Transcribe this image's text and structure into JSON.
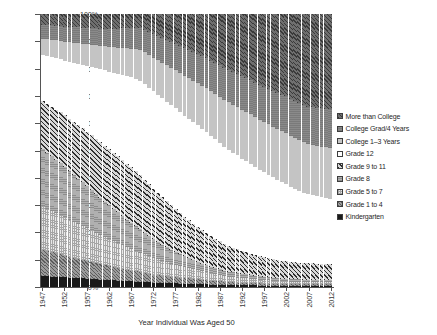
{
  "chart_data": {
    "type": "bar",
    "subtype": "stacked-100-percent",
    "title": "",
    "xlabel": "Year Individual Was Aged 50",
    "ylabel": "",
    "ylim": [
      0,
      100
    ],
    "ytick_labels": [
      "0%",
      "10%",
      "20%",
      "30%",
      "40%",
      "50%",
      "60%",
      "70%",
      "80%",
      "90%",
      "100%"
    ],
    "ytick_values": [
      0,
      10,
      20,
      30,
      40,
      50,
      60,
      70,
      80,
      90,
      100
    ],
    "xtick_labels": [
      "1947",
      "1952",
      "1957",
      "1962",
      "1967",
      "1972",
      "1977",
      "1982",
      "1987",
      "1992",
      "1997",
      "2002",
      "2007",
      "2012"
    ],
    "xtick_values": [
      1947,
      1952,
      1957,
      1962,
      1967,
      1972,
      1977,
      1982,
      1987,
      1992,
      1997,
      2002,
      2007,
      2012
    ],
    "grid": false,
    "legend_position": "right",
    "legend_order_top_to_bottom": [
      "More than College",
      "College Grad/4 Years",
      "College 1–3 Years",
      "Grade 12",
      "Grade 9 to 11",
      "Grade 8",
      "Grade 5 to 7",
      "Grade 1 to 4",
      "Kindergarten"
    ],
    "stack_order_bottom_to_top": [
      "Kindergarten",
      "Grade 1 to 4",
      "Grade 5 to 7",
      "Grade 8",
      "Grade 9 to 11",
      "Grade 12",
      "College 1–3 Years",
      "College Grad/4 Years",
      "More than College"
    ],
    "x": [
      1947,
      1948,
      1949,
      1950,
      1951,
      1952,
      1953,
      1954,
      1955,
      1956,
      1957,
      1958,
      1959,
      1960,
      1961,
      1962,
      1963,
      1964,
      1965,
      1966,
      1967,
      1968,
      1969,
      1970,
      1971,
      1972,
      1973,
      1974,
      1975,
      1976,
      1977,
      1978,
      1979,
      1980,
      1981,
      1982,
      1983,
      1984,
      1985,
      1986,
      1987,
      1988,
      1989,
      1990,
      1991,
      1992,
      1993,
      1994,
      1995,
      1996,
      1997,
      1998,
      1999,
      2000,
      2001,
      2002,
      2003,
      2004,
      2005,
      2006,
      2007,
      2008,
      2009,
      2010,
      2011,
      2012
    ],
    "series": [
      {
        "name": "Kindergarten",
        "values": [
          4.0,
          3.9,
          3.8,
          3.7,
          3.6,
          3.5,
          3.4,
          3.3,
          3.2,
          3.1,
          3.0,
          2.9,
          2.8,
          2.7,
          2.6,
          2.5,
          2.4,
          2.3,
          2.2,
          2.1,
          2.0,
          1.9,
          1.8,
          1.8,
          1.7,
          1.7,
          1.6,
          1.6,
          1.5,
          1.5,
          1.4,
          1.4,
          1.3,
          1.3,
          1.2,
          1.2,
          1.1,
          1.1,
          1.0,
          1.0,
          1.0,
          0.9,
          0.9,
          0.9,
          0.8,
          0.8,
          0.8,
          0.8,
          0.7,
          0.7,
          0.7,
          0.7,
          0.7,
          0.7,
          0.6,
          0.6,
          0.6,
          0.6,
          0.6,
          0.6,
          0.6,
          0.6,
          0.6,
          0.6,
          0.6,
          0.6
        ]
      },
      {
        "name": "Grade 1 to 4",
        "values": [
          9.5,
          9.2,
          8.9,
          8.6,
          8.3,
          8.0,
          7.7,
          7.4,
          7.1,
          6.8,
          6.5,
          6.2,
          5.9,
          5.6,
          5.3,
          5.0,
          4.8,
          4.6,
          4.4,
          4.2,
          4.0,
          3.8,
          3.6,
          3.4,
          3.2,
          3.0,
          2.9,
          2.8,
          2.7,
          2.6,
          2.5,
          2.4,
          2.3,
          2.2,
          2.1,
          2.0,
          1.9,
          1.8,
          1.7,
          1.6,
          1.5,
          1.4,
          1.3,
          1.2,
          1.2,
          1.1,
          1.1,
          1.0,
          1.0,
          1.0,
          0.9,
          0.9,
          0.9,
          0.9,
          0.8,
          0.8,
          0.8,
          0.8,
          0.8,
          0.8,
          0.8,
          0.8,
          0.8,
          0.8,
          0.8,
          0.8
        ]
      },
      {
        "name": "Grade 5 to 7",
        "values": [
          16.0,
          15.6,
          15.2,
          14.8,
          14.4,
          14.0,
          13.6,
          13.2,
          12.8,
          12.4,
          12.0,
          11.6,
          11.2,
          10.8,
          10.4,
          10.0,
          9.6,
          9.2,
          8.8,
          8.4,
          8.0,
          7.6,
          7.2,
          6.9,
          6.6,
          6.3,
          6.0,
          5.7,
          5.4,
          5.1,
          4.8,
          4.5,
          4.3,
          4.1,
          3.9,
          3.7,
          3.5,
          3.3,
          3.1,
          2.9,
          2.7,
          2.5,
          2.4,
          2.3,
          2.2,
          2.1,
          2.0,
          1.9,
          1.8,
          1.7,
          1.6,
          1.6,
          1.5,
          1.5,
          1.4,
          1.4,
          1.3,
          1.3,
          1.3,
          1.2,
          1.2,
          1.2,
          1.2,
          1.1,
          1.1,
          1.1
        ]
      },
      {
        "name": "Grade 8",
        "values": [
          21.0,
          20.5,
          20.0,
          19.5,
          19.0,
          18.4,
          17.8,
          17.2,
          16.6,
          16.0,
          15.4,
          14.8,
          14.2,
          13.6,
          13.0,
          12.4,
          11.8,
          11.2,
          10.6,
          10.0,
          9.5,
          9.0,
          8.5,
          8.0,
          7.5,
          7.0,
          6.6,
          6.2,
          5.8,
          5.4,
          5.0,
          4.7,
          4.4,
          4.1,
          3.8,
          3.5,
          3.3,
          3.1,
          2.9,
          2.7,
          2.5,
          2.3,
          2.2,
          2.1,
          2.0,
          1.9,
          1.8,
          1.7,
          1.6,
          1.5,
          1.5,
          1.4,
          1.4,
          1.3,
          1.3,
          1.2,
          1.2,
          1.2,
          1.1,
          1.1,
          1.1,
          1.1,
          1.0,
          1.0,
          1.0,
          1.0
        ]
      },
      {
        "name": "Grade 9 to 11",
        "values": [
          17.5,
          17.8,
          18.1,
          18.4,
          18.7,
          19.0,
          19.2,
          19.4,
          19.6,
          19.8,
          20.0,
          20.1,
          20.2,
          20.3,
          20.4,
          20.5,
          20.5,
          20.5,
          20.5,
          20.4,
          20.3,
          20.1,
          19.9,
          19.6,
          19.3,
          19.0,
          18.6,
          18.2,
          17.8,
          17.4,
          17.0,
          16.5,
          16.0,
          15.5,
          15.0,
          14.5,
          14.0,
          13.5,
          13.0,
          12.5,
          12.0,
          11.6,
          11.2,
          10.9,
          10.6,
          10.3,
          10.0,
          9.8,
          9.6,
          9.4,
          9.2,
          9.0,
          8.9,
          8.8,
          8.7,
          8.6,
          8.5,
          8.5,
          8.4,
          8.4,
          8.3,
          8.3,
          8.2,
          8.2,
          8.1,
          8.1
        ]
      },
      {
        "name": "Grade 12",
        "values": [
          17.0,
          17.6,
          18.2,
          18.8,
          19.4,
          20.0,
          20.8,
          21.6,
          22.4,
          23.2,
          24.0,
          24.9,
          25.8,
          26.7,
          27.6,
          28.5,
          29.4,
          30.3,
          31.2,
          32.1,
          33.0,
          33.8,
          34.6,
          35.4,
          36.2,
          37.0,
          37.6,
          38.2,
          38.8,
          39.4,
          40.0,
          40.4,
          40.8,
          41.2,
          41.6,
          42.0,
          42.2,
          42.4,
          42.5,
          42.6,
          42.6,
          42.5,
          42.4,
          42.2,
          42.0,
          41.7,
          41.4,
          41.0,
          40.6,
          40.2,
          39.8,
          39.3,
          38.8,
          38.3,
          37.8,
          37.3,
          36.8,
          36.3,
          35.8,
          35.3,
          34.8,
          34.4,
          34.0,
          33.6,
          33.2,
          32.8
        ]
      },
      {
        "name": "College 1–3 Years",
        "values": [
          6.0,
          6.2,
          6.4,
          6.6,
          6.8,
          7.0,
          7.2,
          7.4,
          7.6,
          7.8,
          8.0,
          8.2,
          8.4,
          8.6,
          8.8,
          9.0,
          9.3,
          9.6,
          9.9,
          10.2,
          10.5,
          10.9,
          11.3,
          11.7,
          12.1,
          12.5,
          13.0,
          13.5,
          14.0,
          14.5,
          15.0,
          15.5,
          16.0,
          16.5,
          17.0,
          17.5,
          18.0,
          18.5,
          19.0,
          19.5,
          20.0,
          20.4,
          20.8,
          21.2,
          21.6,
          22.0,
          22.4,
          22.8,
          23.1,
          23.4,
          23.7,
          24.0,
          24.2,
          24.4,
          24.6,
          24.8,
          25.0,
          25.1,
          25.2,
          25.3,
          25.4,
          25.5,
          25.6,
          25.7,
          25.8,
          25.9
        ]
      },
      {
        "name": "College Grad/4 Years",
        "values": [
          5.0,
          5.1,
          5.2,
          5.3,
          5.4,
          5.5,
          5.6,
          5.7,
          5.8,
          5.9,
          6.0,
          6.1,
          6.2,
          6.3,
          6.4,
          6.5,
          6.7,
          6.9,
          7.1,
          7.3,
          7.5,
          7.8,
          8.1,
          8.4,
          8.7,
          9.0,
          9.3,
          9.6,
          9.9,
          10.2,
          10.5,
          10.8,
          11.1,
          11.4,
          11.7,
          12.0,
          12.3,
          12.6,
          12.9,
          13.2,
          13.5,
          13.8,
          14.1,
          14.4,
          14.7,
          15.0,
          15.3,
          15.6,
          15.9,
          16.2,
          16.5,
          16.8,
          17.1,
          17.4,
          17.7,
          18.0,
          18.2,
          18.4,
          18.6,
          18.8,
          19.0,
          19.1,
          19.2,
          19.3,
          19.4,
          19.5
        ]
      },
      {
        "name": "More than College",
        "values": [
          4.0,
          4.1,
          4.2,
          4.3,
          4.4,
          4.6,
          4.7,
          4.8,
          4.9,
          5.0,
          5.1,
          5.2,
          5.3,
          5.4,
          5.5,
          5.6,
          5.5,
          5.4,
          5.3,
          5.3,
          5.2,
          5.1,
          5.0,
          5.8,
          6.7,
          7.5,
          8.4,
          9.2,
          10.1,
          10.9,
          11.8,
          12.8,
          13.8,
          14.7,
          15.7,
          16.6,
          17.7,
          18.7,
          19.9,
          21.0,
          22.2,
          23.6,
          24.7,
          25.8,
          26.9,
          28.1,
          29.2,
          30.4,
          31.7,
          32.9,
          34.1,
          35.3,
          36.5,
          37.7,
          38.9,
          40.1,
          41.6,
          42.8,
          44.2,
          45.5,
          46.8,
          47.0,
          47.4,
          47.7,
          48.0,
          48.2
        ]
      }
    ]
  },
  "legend": {
    "items": [
      {
        "label": "More than College",
        "pattern": "p0"
      },
      {
        "label": "College Grad/4 Years",
        "pattern": "p1"
      },
      {
        "label": "College 1–3 Years",
        "pattern": "p2"
      },
      {
        "label": "Grade 12",
        "pattern": "p3"
      },
      {
        "label": "Grade 9 to 11",
        "pattern": "p4"
      },
      {
        "label": "Grade 8",
        "pattern": "p5"
      },
      {
        "label": "Grade 5 to 7",
        "pattern": "p6"
      },
      {
        "label": "Grade 1 to 4",
        "pattern": "p7"
      },
      {
        "label": "Kindergarten",
        "pattern": "p8"
      }
    ]
  },
  "axis": {
    "x_title": "Year Individual Was Aged 50"
  }
}
